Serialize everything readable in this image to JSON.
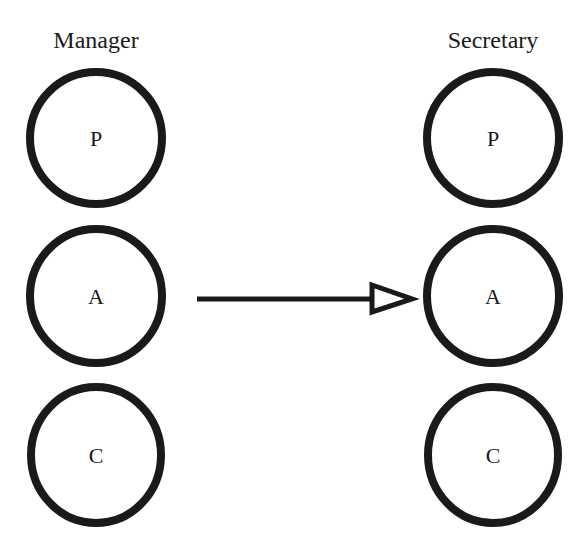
{
  "diagram": {
    "columns": [
      {
        "title": "Manager",
        "nodes": [
          {
            "label": "P"
          },
          {
            "label": "A"
          },
          {
            "label": "C"
          }
        ]
      },
      {
        "title": "Secretary",
        "nodes": [
          {
            "label": "P"
          },
          {
            "label": "A"
          },
          {
            "label": "C"
          }
        ]
      }
    ],
    "edges": [
      {
        "from": "Manager.A",
        "to": "Secretary.A",
        "arrowhead": "hollow-triangle"
      }
    ]
  }
}
